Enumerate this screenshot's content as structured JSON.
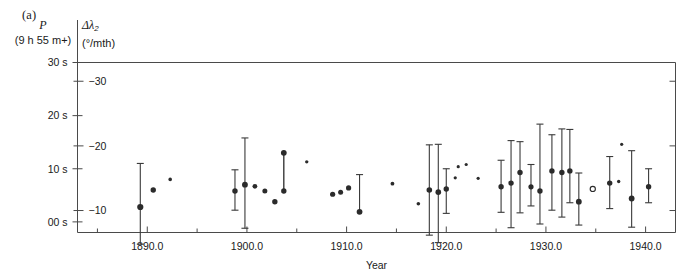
{
  "figure": {
    "panel_label": "(a)",
    "left_axis_title_line1": "P",
    "left_axis_title_line2": "(9 h 55 m+)",
    "right_axis_title_line1": "Δλ",
    "right_axis_title_subscript": "2",
    "right_axis_title_line2": "(°/mth)"
  },
  "chart_data": {
    "type": "scatter",
    "title": "(a)",
    "xlabel": "Year",
    "ylabel_left": "P (9 h 55 m+)",
    "ylabel_right": "Δλ₂ (°/mth)",
    "xlim": [
      1883.0,
      1943.0
    ],
    "xticks": [
      1890.0,
      1900.0,
      1910.0,
      1920.0,
      1930.0,
      1940.0
    ],
    "xtick_labels": [
      "1890.0",
      "1900.0",
      "1910.0",
      "1920.0",
      "1930.0",
      "1940.0"
    ],
    "xminor_ticks": [
      1885.0,
      1895.0,
      1905.0,
      1915.0,
      1925.0,
      1935.0
    ],
    "ylim_left": [
      30.0,
      -2.0
    ],
    "yticks_left": [
      0,
      10,
      20,
      30
    ],
    "ytick_labels_left": [
      "00 s",
      "10 s",
      "20 s",
      "30 s"
    ],
    "ylim_right": [
      -32.9,
      -6.6
    ],
    "yticks_right": [
      -30,
      -20,
      -10
    ],
    "ytick_labels_right": [
      "−30",
      "−20",
      "−10"
    ],
    "grid": false,
    "legend": null,
    "marker_note": "filled circles = measurements; size varies with weight; one open circle near 1935",
    "errorbar_note": "vertical bars are 1-sigma uncertainties; absent on low-weight points",
    "points": [
      {
        "x": 1889.3,
        "y": 2.8,
        "err_lo": 8.2,
        "err_hi": 7.0,
        "size": 5.0,
        "open": false
      },
      {
        "x": 1890.6,
        "y": 6.0,
        "err_lo": 0,
        "err_hi": 0,
        "size": 4.2,
        "open": false
      },
      {
        "x": 1892.3,
        "y": 8.0,
        "err_lo": 0,
        "err_hi": 0,
        "size": 2.4,
        "open": false
      },
      {
        "x": 1898.8,
        "y": 5.8,
        "err_lo": 4.0,
        "err_hi": 3.6,
        "size": 4.2,
        "open": false
      },
      {
        "x": 1899.8,
        "y": 7.0,
        "err_lo": 8.8,
        "err_hi": 8.2,
        "size": 4.6,
        "open": false
      },
      {
        "x": 1900.8,
        "y": 6.7,
        "err_lo": 0,
        "err_hi": 0,
        "size": 3.6,
        "open": false
      },
      {
        "x": 1901.8,
        "y": 5.8,
        "err_lo": 0,
        "err_hi": 0,
        "size": 3.8,
        "open": false
      },
      {
        "x": 1902.8,
        "y": 3.8,
        "err_lo": 0,
        "err_hi": 0,
        "size": 4.2,
        "open": false
      },
      {
        "x": 1903.7,
        "y": 5.8,
        "err_lo": 0,
        "err_hi": 0,
        "size": 4.2,
        "open": false
      },
      {
        "x": 1903.7,
        "y": 13.0,
        "err_lo": 0,
        "err_hi": 0,
        "size": 4.6,
        "open": false,
        "connect_to_prev": true
      },
      {
        "x": 1906.0,
        "y": 11.3,
        "err_lo": 0,
        "err_hi": 0,
        "size": 2.2,
        "open": false
      },
      {
        "x": 1908.6,
        "y": 5.2,
        "err_lo": 0,
        "err_hi": 0,
        "size": 4.0,
        "open": false
      },
      {
        "x": 1909.4,
        "y": 5.6,
        "err_lo": 0,
        "err_hi": 0,
        "size": 3.8,
        "open": false
      },
      {
        "x": 1910.2,
        "y": 6.4,
        "err_lo": 0,
        "err_hi": 0,
        "size": 4.0,
        "open": false
      },
      {
        "x": 1911.3,
        "y": 1.9,
        "err_lo": 7.0,
        "err_hi": 0,
        "size": 4.6,
        "open": false
      },
      {
        "x": 1914.6,
        "y": 7.2,
        "err_lo": 0,
        "err_hi": 0,
        "size": 2.6,
        "open": false
      },
      {
        "x": 1917.2,
        "y": 3.4,
        "err_lo": 0,
        "err_hi": 0,
        "size": 2.4,
        "open": false
      },
      {
        "x": 1918.3,
        "y": 6.0,
        "err_lo": 8.5,
        "err_hi": 8.5,
        "size": 4.4,
        "open": false
      },
      {
        "x": 1919.2,
        "y": 5.6,
        "err_lo": 9.0,
        "err_hi": 9.5,
        "size": 4.4,
        "open": false
      },
      {
        "x": 1920.0,
        "y": 6.2,
        "err_lo": 3.8,
        "err_hi": 4.6,
        "size": 4.2,
        "open": false
      },
      {
        "x": 1920.9,
        "y": 8.3,
        "err_lo": 0,
        "err_hi": 0,
        "size": 2.0,
        "open": false
      },
      {
        "x": 1921.2,
        "y": 10.4,
        "err_lo": 0,
        "err_hi": 0,
        "size": 2.0,
        "open": false
      },
      {
        "x": 1922.0,
        "y": 10.8,
        "err_lo": 0,
        "err_hi": 0,
        "size": 2.0,
        "open": false
      },
      {
        "x": 1923.2,
        "y": 8.2,
        "err_lo": 0,
        "err_hi": 0,
        "size": 2.0,
        "open": false
      },
      {
        "x": 1925.5,
        "y": 6.6,
        "err_lo": 5.0,
        "err_hi": 4.8,
        "size": 4.2,
        "open": false
      },
      {
        "x": 1926.5,
        "y": 7.3,
        "err_lo": 8.0,
        "err_hi": 8.4,
        "size": 4.2,
        "open": false
      },
      {
        "x": 1927.4,
        "y": 9.3,
        "err_lo": 5.8,
        "err_hi": 7.6,
        "size": 4.2,
        "open": false
      },
      {
        "x": 1928.5,
        "y": 6.6,
        "err_lo": 4.2,
        "err_hi": 3.6,
        "size": 4.0,
        "open": false
      },
      {
        "x": 1929.4,
        "y": 5.8,
        "err_lo": 12.6,
        "err_hi": 6.2,
        "size": 4.2,
        "open": false
      },
      {
        "x": 1930.6,
        "y": 9.6,
        "err_lo": 6.8,
        "err_hi": 7.4,
        "size": 4.2,
        "open": false
      },
      {
        "x": 1931.6,
        "y": 9.3,
        "err_lo": 8.2,
        "err_hi": 8.4,
        "size": 4.2,
        "open": false
      },
      {
        "x": 1932.4,
        "y": 9.6,
        "err_lo": 7.8,
        "err_hi": 6.0,
        "size": 4.2,
        "open": false
      },
      {
        "x": 1933.3,
        "y": 3.8,
        "err_lo": 5.4,
        "err_hi": 4.4,
        "size": 4.6,
        "open": false
      },
      {
        "x": 1934.7,
        "y": 6.2,
        "err_lo": 0,
        "err_hi": 0,
        "size": 4.0,
        "open": true
      },
      {
        "x": 1936.4,
        "y": 7.3,
        "err_lo": 5.0,
        "err_hi": 4.8,
        "size": 4.2,
        "open": false
      },
      {
        "x": 1937.3,
        "y": 7.6,
        "err_lo": 0,
        "err_hi": 0,
        "size": 2.2,
        "open": false
      },
      {
        "x": 1937.6,
        "y": 14.6,
        "err_lo": 0,
        "err_hi": 0,
        "size": 2.0,
        "open": false
      },
      {
        "x": 1938.6,
        "y": 4.4,
        "err_lo": 9.0,
        "err_hi": 5.4,
        "size": 4.6,
        "open": false
      },
      {
        "x": 1940.3,
        "y": 6.6,
        "err_lo": 3.4,
        "err_hi": 3.0,
        "size": 4.2,
        "open": false
      }
    ]
  }
}
